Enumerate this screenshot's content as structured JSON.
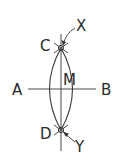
{
  "diagram": {
    "type": "geometric-construction",
    "labels": {
      "A": "A",
      "B": "B",
      "C": "C",
      "D": "D",
      "M": "M",
      "X": "X",
      "Y": "Y"
    },
    "colors": {
      "stroke": "#3a3a3a",
      "text": "#2a2a2a",
      "background": "#ffffff"
    }
  }
}
